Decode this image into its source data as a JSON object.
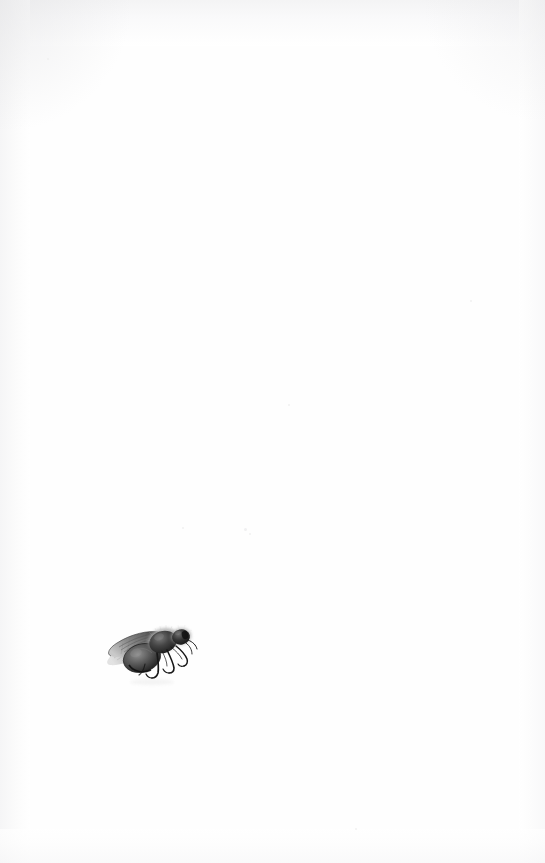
{
  "page": {
    "kind": "scanned-book-page",
    "orientation": "portrait",
    "width_px": 545,
    "height_px": 863,
    "background_color": "#ffffff",
    "paper_tone": "#fefefe",
    "visible_text": "",
    "text_note": "No text, captions, page numbers or marginalia are visible on this page.",
    "edge_shading_color": "#f3f3f4"
  },
  "illustration": {
    "name": "bee-illustration",
    "subject": "bee",
    "description": "Small naturalistic grayscale illustration of a bee shown in three-quarter side view, head toward the upper right, wings folded back over the abdomen toward the left, six thin legs trailing to the right and below.",
    "technique": "engraving / stipple wash",
    "palette": {
      "darkest": "#1a1a1a",
      "body_dark": "#2e2e2e",
      "body_mid": "#5b5b5b",
      "body_light": "#8d8d8d",
      "wing_gray": "#6e6e6e",
      "wing_light": "#b6b6b6",
      "fuzz_light": "#cfcfcf",
      "paper": "#ffffff"
    },
    "position": {
      "left_px": 106,
      "top_px": 620,
      "width_px": 89,
      "height_px": 66,
      "quadrant": "lower-left"
    },
    "parts": [
      {
        "name": "head",
        "tone": "#262626"
      },
      {
        "name": "thorax",
        "tone": "#3a3a3a"
      },
      {
        "name": "abdomen",
        "tone": "#4a4a4a"
      },
      {
        "name": "forewing",
        "tone": "#7a7a7a"
      },
      {
        "name": "hindwing",
        "tone": "#9a9a9a"
      },
      {
        "name": "legs",
        "tone": "#1f1f1f"
      },
      {
        "name": "antenna",
        "tone": "#232323"
      }
    ]
  },
  "specks": [
    {
      "x": 244,
      "y": 528,
      "d": 3
    },
    {
      "x": 249,
      "y": 533,
      "d": 2
    },
    {
      "x": 288,
      "y": 404,
      "d": 2
    },
    {
      "x": 182,
      "y": 527,
      "d": 2
    },
    {
      "x": 47,
      "y": 58,
      "d": 2
    },
    {
      "x": 470,
      "y": 300,
      "d": 2
    },
    {
      "x": 355,
      "y": 828,
      "d": 2
    }
  ]
}
